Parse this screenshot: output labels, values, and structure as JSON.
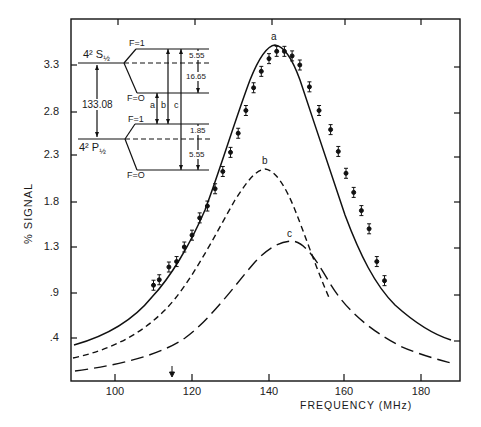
{
  "chart_data": {
    "type": "line",
    "title": "",
    "xlabel": "FREQUENCY (MHz)",
    "ylabel": "% SIGNAL",
    "xlim": [
      89,
      190
    ],
    "ylim": [
      0.15,
      3.8
    ],
    "x_ticks": [
      "100",
      "120",
      "140",
      "160",
      "180"
    ],
    "y_ticks": [
      "3.3",
      "2.8",
      "2.3",
      "1.8",
      "1.3",
      ".9",
      ".4"
    ],
    "grid": false,
    "legend": null,
    "series": [
      {
        "name": "a",
        "style": "solid line with data points and error bars",
        "peak": {
          "x": 141.5,
          "y": 3.52
        },
        "x": [
          90,
          100,
          110,
          120,
          130,
          135,
          140,
          141.5,
          145,
          150,
          160,
          170,
          180,
          188
        ],
        "y": [
          0.43,
          0.62,
          1.0,
          1.6,
          2.6,
          3.15,
          3.5,
          3.52,
          3.38,
          2.8,
          1.6,
          0.95,
          0.62,
          0.48
        ]
      },
      {
        "name": "a (measured points)",
        "style": "points with error bars",
        "x": [
          110,
          111.5,
          114,
          116,
          118,
          120,
          122,
          124,
          126,
          128,
          130,
          132,
          134,
          136,
          138,
          140,
          142,
          144,
          146,
          148,
          150.5,
          153,
          156,
          158,
          160,
          162,
          164,
          166,
          168,
          170
        ],
        "y": [
          0.88,
          0.94,
          1.08,
          1.14,
          1.3,
          1.43,
          1.62,
          1.75,
          1.94,
          2.13,
          2.34,
          2.55,
          2.8,
          3.05,
          3.23,
          3.37,
          3.45,
          3.45,
          3.4,
          3.3,
          3.06,
          2.8,
          2.59,
          2.35,
          2.11,
          1.9,
          1.7,
          1.5,
          1.14,
          0.93
        ]
      },
      {
        "name": "b",
        "style": "short-dashed line",
        "peak": {
          "x": 139,
          "y": 2.16
        },
        "x": [
          90,
          100,
          110,
          120,
          130,
          139,
          145,
          150,
          155,
          160
        ],
        "y": [
          0.29,
          0.45,
          0.72,
          1.15,
          1.75,
          2.16,
          1.95,
          1.5,
          1.05,
          0.7
        ]
      },
      {
        "name": "c",
        "style": "long-dashed line",
        "peak": {
          "x": 146,
          "y": 1.37
        },
        "x": [
          90,
          100,
          110,
          115,
          120,
          130,
          140,
          146,
          150,
          155,
          160,
          170,
          180,
          188
        ],
        "y": [
          0.16,
          0.22,
          0.32,
          0.4,
          0.5,
          0.8,
          1.2,
          1.37,
          1.3,
          1.1,
          0.85,
          0.55,
          0.38,
          0.3
        ]
      }
    ],
    "annotations": [
      {
        "text": "a",
        "at": {
          "x": 141.5,
          "y": 3.62
        }
      },
      {
        "text": "b",
        "at": {
          "x": 139,
          "y": 2.25
        }
      },
      {
        "text": "c",
        "at": {
          "x": 146,
          "y": 1.45
        }
      },
      {
        "text": "arrow marker",
        "at": {
          "x": 115,
          "y": "below curves, pointing down to x-axis"
        }
      }
    ],
    "inset_energy_diagram": {
      "upper_level": "4² S½",
      "lower_level": "4² P½",
      "level_separation": "133.08",
      "upper_sublevels": [
        "F=1",
        "F=0"
      ],
      "lower_sublevels": [
        "F=1",
        "F=0"
      ],
      "upper_splittings": [
        "5.55",
        "16.65"
      ],
      "lower_splittings": [
        "1.85",
        "5.55"
      ],
      "transitions": [
        "a",
        "b",
        "c"
      ]
    }
  },
  "axes": {
    "xlabel": "FREQUENCY (MHz)",
    "ylabel": "% SIGNAL",
    "x_ticks": [
      "100",
      "120",
      "140",
      "160",
      "180"
    ],
    "y_ticks": [
      "3.3",
      "2.8",
      "2.3",
      "1.8",
      "1.3",
      ".9",
      ".4"
    ]
  },
  "labels": {
    "a": "a",
    "b": "b",
    "c": "c"
  },
  "inset": {
    "upper_term": "4² S",
    "upper_sub": "½",
    "lower_term": "4² P",
    "lower_sub": "½",
    "sep": "133.08",
    "f1_upper": "F=1",
    "f0_upper": "F=O",
    "f1_lower": "F=1",
    "f0_lower": "F=O",
    "s1": "5.55",
    "s2": "16.65",
    "s3": "1.85",
    "s4": "5.55",
    "ta": "a",
    "tb": "b",
    "tc": "c"
  }
}
